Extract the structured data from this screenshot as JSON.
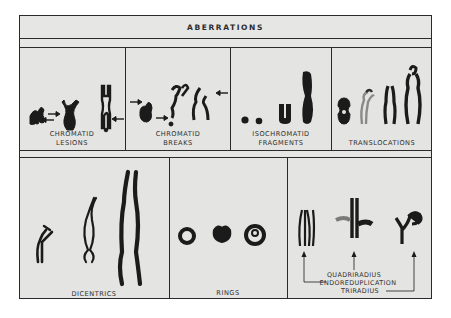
{
  "figure": {
    "title": "ABERRATIONS",
    "colors": {
      "background": "#e5e5e3",
      "ink": "#1e1e1e",
      "border": "#2a2a2a"
    },
    "row1": [
      {
        "id": "chromatid-lesions",
        "label_line1": "CHROMATID",
        "label_line2": "LESIONS"
      },
      {
        "id": "chromatid-breaks",
        "label_line1": "CHROMATID",
        "label_line2": "BREAKS"
      },
      {
        "id": "isochromatid-fragments",
        "label_line1": "ISOCHROMATID",
        "label_line2": "FRAGMENTS"
      },
      {
        "id": "translocations",
        "label_line1": "TRANSLOCATIONS",
        "label_line2": ""
      }
    ],
    "row2": [
      {
        "id": "dicentrics",
        "label": "DICENTRICS"
      },
      {
        "id": "rings",
        "label": "RINGS"
      },
      {
        "id": "complex",
        "notes": [
          "QUADRIRADIUS",
          "ENDOREDUPLICATION",
          "TRIRADIUS"
        ]
      }
    ]
  }
}
